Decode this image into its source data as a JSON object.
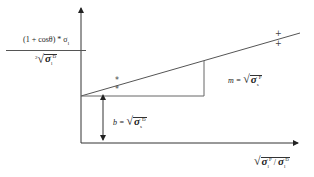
{
  "diagram": {
    "type": "linear-plot-schematic",
    "y_axis_label": {
      "numerator": "(1 + cosθ) * σ",
      "numerator_subscript": "l",
      "denominator_prefix": "2",
      "denominator_symbol": "σ",
      "denominator_subscript": "l",
      "denominator_superscript": "D"
    },
    "x_axis_label": {
      "symbol_1": "σ",
      "sub_1": "l",
      "sup_1": "P",
      "divider": "/",
      "symbol_2": "σ",
      "sub_2": "l",
      "sup_2": "D"
    },
    "slope_label": {
      "prefix": "m =",
      "symbol": "σ",
      "subscript": "s",
      "superscript": "P"
    },
    "intercept_label": {
      "prefix": "b =",
      "symbol": "σ",
      "subscript": "s",
      "superscript": "D"
    },
    "markers": [
      {
        "symbol": "*",
        "x": 118,
        "y": 81
      },
      {
        "symbol": "*",
        "x": 118,
        "y": 90
      },
      {
        "symbol": "+",
        "x": 278,
        "y": 34
      },
      {
        "symbol": "+",
        "x": 278,
        "y": 44
      }
    ],
    "colors": {
      "line": "#555555",
      "axis": "#333333",
      "background": "#ffffff"
    }
  }
}
